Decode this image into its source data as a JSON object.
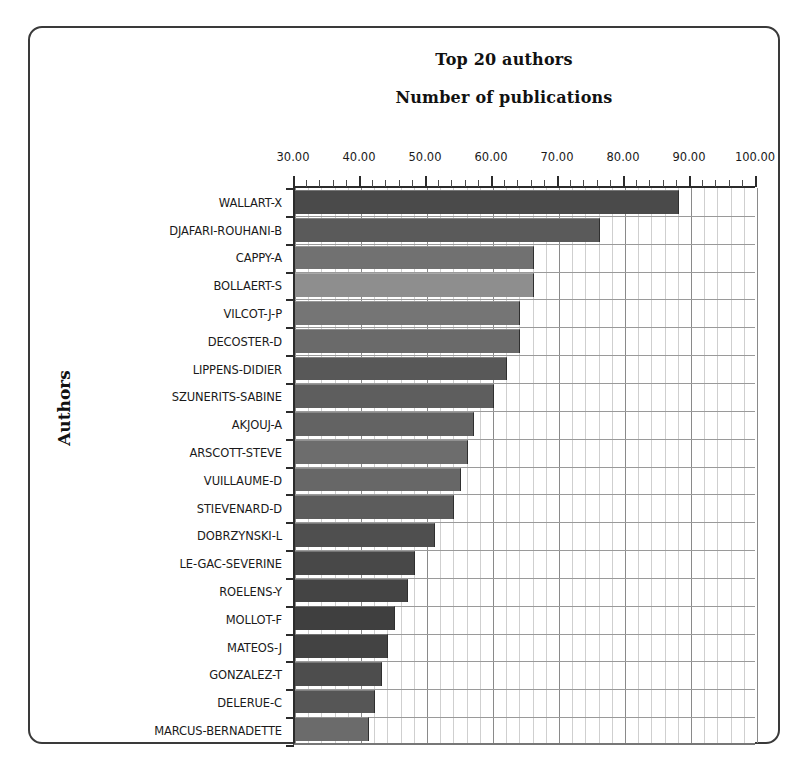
{
  "chart_data": {
    "type": "bar",
    "orientation": "horizontal",
    "title": "Top 20 authors",
    "subtitle": "Number of publications",
    "xlabel": "Number of publications",
    "ylabel": "Authors",
    "xlim": [
      30,
      100
    ],
    "x_tick_labels": [
      "30.00",
      "40.00",
      "50.00",
      "60.00",
      "70.00",
      "80.00",
      "90.00",
      "100.00"
    ],
    "x_tick_values": [
      30,
      40,
      50,
      60,
      70,
      80,
      90,
      100
    ],
    "x_minor_step": 2,
    "grid": true,
    "legend": "none",
    "categories": [
      "WALLART-X",
      "DJAFARI-ROUHANI-B",
      "CAPPY-A",
      "BOLLAERT-S",
      "VILCOT-J-P",
      "DECOSTER-D",
      "LIPPENS-DIDIER",
      "SZUNERITS-SABINE",
      "AKJOUJ-A",
      "ARSCOTT-STEVE",
      "VUILLAUME-D",
      "STIEVENARD-D",
      "DOBRZYNSKI-L",
      "LE-GAC-SEVERINE",
      "ROELENS-Y",
      "MOLLOT-F",
      "MATEOS-J",
      "GONZALEZ-T",
      "DELERUE-C",
      "MARCUS-BERNADETTE"
    ],
    "values": [
      88,
      76,
      66,
      66,
      64,
      64,
      62,
      60,
      57,
      56,
      55,
      54,
      51,
      48,
      47,
      45,
      44,
      43,
      42,
      41
    ],
    "bar_colors": [
      "#4a4a4a",
      "#5a5a5a",
      "#717171",
      "#8e8e8e",
      "#757575",
      "#6a6a6a",
      "#585858",
      "#5e5e5e",
      "#636363",
      "#6d6d6d",
      "#676767",
      "#5c5c5c",
      "#4f4f4f",
      "#484848",
      "#444444",
      "#3f3f3f",
      "#434343",
      "#4d4d4d",
      "#565656",
      "#6b6b6b"
    ]
  },
  "frame": {
    "border_color": "#3a3a3a",
    "background": "#ffffff"
  }
}
